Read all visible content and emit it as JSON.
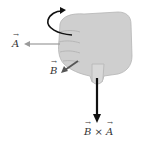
{
  "diagram": {
    "labels": {
      "vector_a": "A",
      "vector_b": "B",
      "result_b": "B",
      "result_times": " × ",
      "result_a": "A"
    },
    "colors": {
      "hand": "#cfcfcf",
      "hand_outline": "#a8a8a8",
      "vector_a": "#9a9a9a",
      "vector_b": "#555555",
      "result": "#111111",
      "curl_arrow": "#111111"
    }
  }
}
